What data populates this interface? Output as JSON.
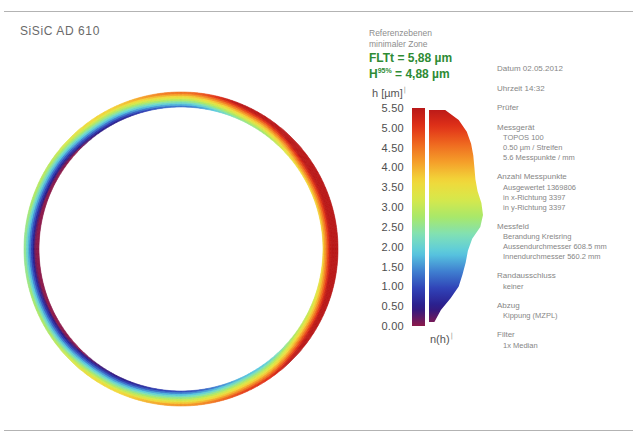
{
  "document": {
    "title": "SiSiC AD 610"
  },
  "legend": {
    "reference_lines": [
      "Referenzebenen",
      "minimaler Zone"
    ],
    "metrics": [
      {
        "name": "FLTt",
        "sup": "",
        "equals": "=",
        "value": "5,88 µm",
        "color": "#2e8b34"
      },
      {
        "name": "H",
        "sup": "95%",
        "equals": "=",
        "value": "4,88 µm",
        "color": "#2e8b34"
      }
    ]
  },
  "scale": {
    "unit_label": "h [µm]",
    "ticks": [
      "5.50",
      "5.00",
      "4.50",
      "4.00",
      "3.50",
      "3.00",
      "2.50",
      "2.00",
      "1.50",
      "1.00",
      "0.50",
      "0.00"
    ],
    "min": 0.0,
    "max": 5.5,
    "step": 0.5,
    "histogram_label": "n(h)"
  },
  "meta": {
    "groups": [
      {
        "head": "Datum  02.05.2012",
        "subs": []
      },
      {
        "head": "Uhrzeit  14:32",
        "subs": []
      },
      {
        "head": "Prüfer",
        "subs": []
      },
      {
        "head": "Messgerät",
        "subs": [
          "TOPOS 100",
          "0.50 µm / Streifen",
          "5.6 Messpunkte / mm"
        ]
      },
      {
        "head": "Anzahl Messpunkte",
        "subs": [
          "Ausgewertet  1369806",
          "in x-Richtung  3397",
          "in y-Richtung  3397"
        ]
      },
      {
        "head": "Messfeld",
        "subs": [
          "Berandung  Kreisring",
          "Aussendurchmesser  608.5 mm",
          "Innendurchmesser  560.2 mm"
        ]
      },
      {
        "head": "Randausschluss",
        "subs": [
          "keiner"
        ]
      },
      {
        "head": "Abzug",
        "subs": [
          "Kippung (MZPL)"
        ]
      },
      {
        "head": "Filter",
        "subs": [
          "1x Median"
        ]
      }
    ]
  },
  "chart_data": {
    "type": "heatmap",
    "title": "SiSiC AD 610",
    "zlabel": "h [µm]",
    "zlim": [
      0.0,
      5.5
    ],
    "ztick_step": 0.5,
    "ztick_labels": [
      "0.00",
      "0.50",
      "1.00",
      "1.50",
      "2.00",
      "2.50",
      "3.00",
      "3.50",
      "4.00",
      "4.50",
      "5.00",
      "5.50"
    ],
    "colormap": [
      "#8c1a4a",
      "#2a1a86",
      "#2f3fb5",
      "#3f7fd0",
      "#58c8e0",
      "#7fe0b8",
      "#a8e86a",
      "#d8e84a",
      "#f2d83a",
      "#f5a02a",
      "#ef6a20",
      "#e03018",
      "#b81818"
    ],
    "geometry": {
      "shape": "annulus",
      "outer_diameter_mm": 608.5,
      "inner_diameter_mm": 560.2
    },
    "angular_profile": {
      "note": "Height of the ring band as a function of angle, degrees measured clockwise from top (12 o'clock). Values in µm read from the colour of the band.",
      "angles_deg": [
        0,
        30,
        60,
        90,
        120,
        150,
        180,
        210,
        240,
        270,
        300,
        330
      ],
      "values_um": [
        2.9,
        4.2,
        5.3,
        5.4,
        4.6,
        3.4,
        2.6,
        2.0,
        1.2,
        0.9,
        1.3,
        2.1
      ]
    },
    "radial_profile": {
      "note": "Across the band width the colour sweeps the full scale, high (red) on the outer edge at the right side and low (blue/violet) on the inner edge at the left side.",
      "bands": 5
    },
    "histogram": {
      "note": "n(h) distribution plotted beside the colour bar; width is relative frequency.",
      "bin_centers_um": [
        0.1,
        0.4,
        0.7,
        1.0,
        1.3,
        1.6,
        1.9,
        2.2,
        2.5,
        2.8,
        3.1,
        3.4,
        3.7,
        4.0,
        4.3,
        4.6,
        4.9,
        5.2,
        5.45
      ],
      "rel_frequency": [
        0.1,
        0.22,
        0.4,
        0.55,
        0.62,
        0.68,
        0.72,
        0.8,
        0.95,
        1.0,
        0.97,
        0.9,
        0.86,
        0.84,
        0.82,
        0.78,
        0.7,
        0.55,
        0.3
      ]
    }
  }
}
